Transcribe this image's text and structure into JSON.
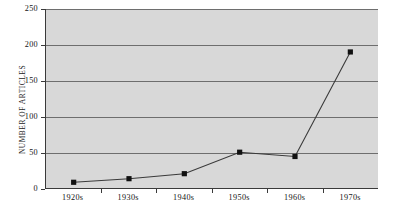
{
  "chart_data": {
    "type": "line",
    "title": "",
    "subtitle": "",
    "xlabel": "",
    "ylabel": "NUMBER OF ARTICLES",
    "categories": [
      "1920s",
      "1930s",
      "1940s",
      "1950s",
      "1960s",
      "1970s"
    ],
    "values": [
      8,
      13,
      20,
      50,
      44,
      190
    ],
    "series": [
      {
        "name": "Number of articles",
        "values": [
          8,
          13,
          20,
          50,
          44,
          190
        ]
      }
    ],
    "ylim": [
      0,
      250
    ],
    "y_ticks": [
      0,
      50,
      100,
      150,
      200,
      250
    ],
    "y_tick_labels": [
      "0",
      "50",
      "100",
      "150",
      "200",
      "250"
    ],
    "grid": true,
    "grid_axis": "y",
    "legend": false,
    "legend_position": "none",
    "marker": "square",
    "annotations": []
  },
  "style": {
    "plot_background": "#d8d8d8",
    "page_background": "#ffffff",
    "gridline_color": "#6e6e6e",
    "axis_color": "#3a3a3a",
    "line_color": "#3a3a3a",
    "marker_color": "#111111",
    "text_color": "#141414"
  }
}
